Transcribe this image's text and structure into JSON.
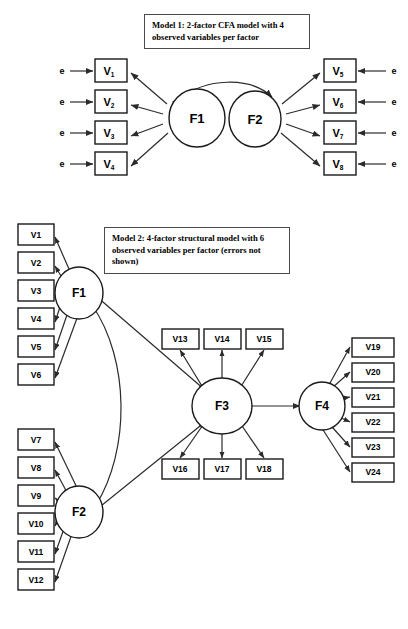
{
  "figure": {
    "background_color": "#ffffff",
    "line_color": "#2b2b2b",
    "box_fill": "#ffffff",
    "box_stroke": "#1a1a1a"
  },
  "model1": {
    "caption": "Model 1: 2-factor CFA model with 4 observed variables per factor",
    "factors": [
      {
        "id": "f1",
        "label": "F1"
      },
      {
        "id": "f2",
        "label": "F2"
      }
    ],
    "left_variables": [
      {
        "name": "V",
        "sub": "1"
      },
      {
        "name": "V",
        "sub": "2"
      },
      {
        "name": "V",
        "sub": "3"
      },
      {
        "name": "V",
        "sub": "4"
      }
    ],
    "right_variables": [
      {
        "name": "V",
        "sub": "5"
      },
      {
        "name": "V",
        "sub": "6"
      },
      {
        "name": "V",
        "sub": "7"
      },
      {
        "name": "V",
        "sub": "8"
      }
    ],
    "error_label": "e",
    "error_count_left": 4,
    "error_count_right": 4,
    "factor_covariance": "double-headed curved arrow between F1 and F2"
  },
  "model2": {
    "caption": "Model 2: 4-factor structural model with 6 observed variables per factor (errors not shown)",
    "factors": [
      {
        "id": "f1",
        "label": "F1"
      },
      {
        "id": "f2",
        "label": "F2"
      },
      {
        "id": "f3",
        "label": "F3"
      },
      {
        "id": "f4",
        "label": "F4"
      }
    ],
    "f1_variables": [
      "V1",
      "V2",
      "V3",
      "V4",
      "V5",
      "V6"
    ],
    "f2_variables": [
      "V7",
      "V8",
      "V9",
      "V10",
      "V11",
      "V12"
    ],
    "f3_variables_top": [
      "V13",
      "V14",
      "V15"
    ],
    "f3_variables_bottom": [
      "V16",
      "V17",
      "V18"
    ],
    "f4_variables": [
      "V19",
      "V20",
      "V21",
      "V22",
      "V23",
      "V24"
    ],
    "structural_paths": [
      "F1 -> F3",
      "F2 -> F3",
      "F3 -> F4",
      "F1 <-> F2"
    ]
  }
}
